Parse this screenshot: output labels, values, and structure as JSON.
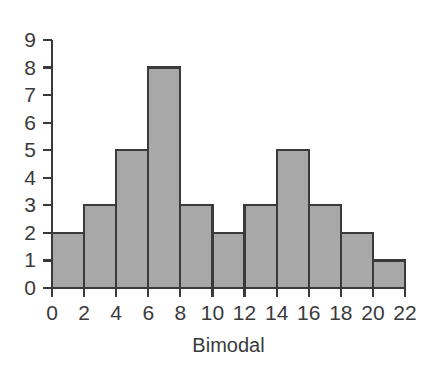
{
  "chart_data": {
    "type": "bar",
    "title": "",
    "subtitle": "",
    "xlabel": "Bimodal",
    "ylabel": "",
    "categories": [
      "0-2",
      "2-4",
      "4-6",
      "6-8",
      "8-10",
      "10-12",
      "12-14",
      "14-16",
      "16-18",
      "18-20",
      "20-22"
    ],
    "bin_edges": [
      0,
      2,
      4,
      6,
      8,
      10,
      12,
      14,
      16,
      18,
      20,
      22
    ],
    "values": [
      2,
      3,
      5,
      8,
      3,
      2,
      3,
      5,
      3,
      2,
      1
    ],
    "xlim": [
      0,
      22
    ],
    "ylim": [
      0,
      9
    ],
    "x_ticks": [
      0,
      2,
      4,
      6,
      8,
      10,
      12,
      14,
      16,
      18,
      20,
      22
    ],
    "y_ticks": [
      0,
      1,
      2,
      3,
      4,
      5,
      6,
      7,
      8,
      9
    ],
    "x_tick_labels": [
      "0",
      "2",
      "4",
      "6",
      "8",
      "10",
      "12",
      "14",
      "16",
      "18",
      "20",
      "22"
    ],
    "y_tick_labels": [
      "0",
      "1",
      "2",
      "3",
      "4",
      "5",
      "6",
      "7",
      "8",
      "9"
    ],
    "grid": false,
    "legend": false,
    "legend_position": "none",
    "bar_fill_color": "#a8a8a8",
    "bar_edge_color": "#3a3a3a",
    "axis_color": "#3a3a3a",
    "text_color": "#3a3a3a",
    "background_color": "#ffffff"
  }
}
